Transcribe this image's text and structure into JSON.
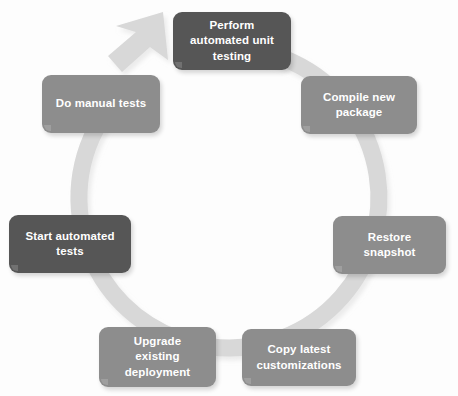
{
  "diagram": {
    "type": "cycle",
    "title": "",
    "background_color": "#fdfdfd",
    "ring": {
      "color": "#d8d8d8",
      "shadow_color": "#e6e6e6",
      "center_x": 229,
      "center_y": 198,
      "radius": 150,
      "thickness": 17,
      "direction": "clockwise",
      "arrowhead_label": "cycle-arrowhead"
    },
    "colors": {
      "dark_node": "#565656",
      "grey_node": "#8d8d8d",
      "node_text": "#ffffff"
    },
    "nodes": [
      {
        "id": "perform-automated-unit-testing",
        "label": "Perform\nautomated unit\ntesting",
        "emphasis": "dark",
        "x": 173,
        "y": 12,
        "width": 118,
        "height": 58
      },
      {
        "id": "compile-new-package",
        "label": "Compile new\npackage",
        "emphasis": "grey",
        "x": 301,
        "y": 76,
        "width": 116,
        "height": 58
      },
      {
        "id": "restore-snapshot",
        "label": "Restore\nsnapshot",
        "emphasis": "grey",
        "x": 333,
        "y": 216,
        "width": 113,
        "height": 58
      },
      {
        "id": "copy-latest-customizations",
        "label": "Copy latest\ncustomizations",
        "emphasis": "grey",
        "x": 242,
        "y": 329,
        "width": 114,
        "height": 57
      },
      {
        "id": "upgrade-existing-deployment",
        "label": "Upgrade\nexisting\ndeployment",
        "emphasis": "grey",
        "x": 99,
        "y": 327,
        "width": 117,
        "height": 60
      },
      {
        "id": "start-automated-tests",
        "label": "Start automated\ntests",
        "emphasis": "dark",
        "x": 9,
        "y": 215,
        "width": 122,
        "height": 58
      },
      {
        "id": "do-manual-tests",
        "label": "Do manual tests",
        "emphasis": "grey",
        "x": 42,
        "y": 75,
        "width": 118,
        "height": 58
      }
    ]
  }
}
